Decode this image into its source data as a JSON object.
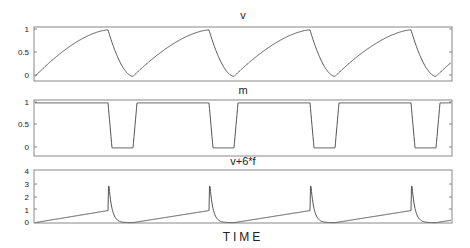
{
  "chart_data": [
    {
      "type": "line",
      "title": "v",
      "xlabel": "",
      "ylabel": "",
      "yticks": [
        0,
        0.5,
        1
      ],
      "ytick_labels": [
        "0",
        "0.5",
        "1"
      ],
      "ylim": [
        -0.05,
        1.1
      ],
      "description": "Sawtooth-like oscillation: slow concave rise from 0 to ~1, then fast decay to ~-0.03, repeating with 4 cycles",
      "cycle_peaks_x_frac": [
        0.176,
        0.413,
        0.649,
        0.886
      ],
      "peak_value": 0.98,
      "min_value": -0.03
    },
    {
      "type": "line",
      "title": "m",
      "xlabel": "",
      "ylabel": "",
      "yticks": [
        0,
        0.5,
        1
      ],
      "ytick_labels": [
        "0",
        "0.5",
        "1"
      ],
      "ylim": [
        -0.1,
        1.1
      ],
      "description": "Square-wave-like: stays ~0.98, drops sharply to ~-0.02 for a short interval, then recovers; 4 dips",
      "high_value": 0.98,
      "low_value": -0.02
    },
    {
      "type": "line",
      "title": "v+6*f",
      "xlabel": "TIME",
      "ylabel": "",
      "yticks": [
        0,
        1,
        2,
        3,
        4
      ],
      "ytick_labels": [
        "0",
        "1",
        "2",
        "3",
        "4"
      ],
      "ylim": [
        -0.1,
        4
      ],
      "description": "Slow linear rise to ~0.9, sharp spike to ~3.2, fast decay to ~-0.05; 4 spikes",
      "spike_value": 3.2,
      "pre_spike_value": 0.9,
      "min_value": -0.05
    }
  ],
  "labels": {
    "panel1_title": "v",
    "panel2_title": "m",
    "panel3_title": "v+6*f",
    "xlabel": "TIME"
  },
  "colors": {
    "line": "#555555",
    "frame": "#888888",
    "text": "#222222"
  }
}
